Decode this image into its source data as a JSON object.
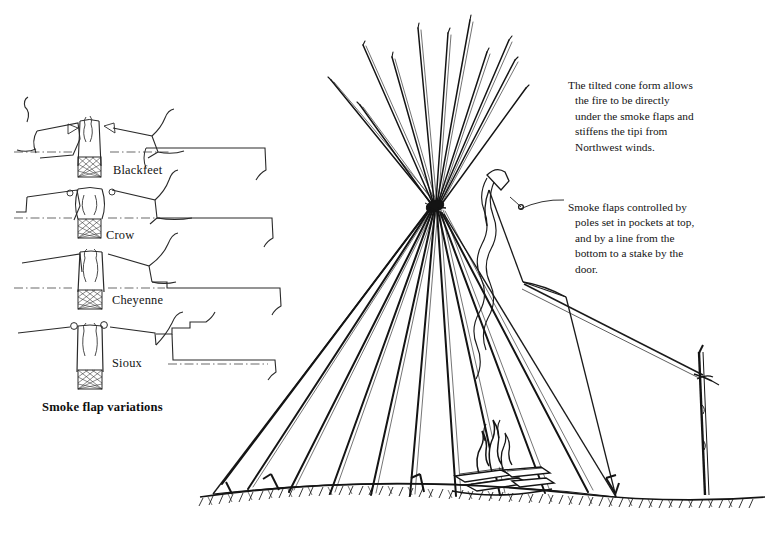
{
  "figure": {
    "background_color": "#ffffff",
    "ink_color": "#1a1a1a"
  },
  "annotations": [
    {
      "id": "tilted-cone",
      "text": "The tilted cone form allows the fire to be directly under the smoke flaps and stiffens the tipi from Northwest winds.",
      "has_leader_line": false
    },
    {
      "id": "smoke-flaps",
      "text": "Smoke flaps controlled by poles set in pockets at top, and by a line from the bottom to a stake by the door.",
      "has_leader_line": true
    }
  ],
  "variations": {
    "caption": "Smoke flap variations",
    "items": [
      {
        "label": "Blackfeet",
        "flap_detail": "triangular pocket sewn at flap tip, narrow chimney throat"
      },
      {
        "label": "Crow",
        "flap_detail": "round eyelets at flap tips, wide flaring chimney"
      },
      {
        "label": "Cheyenne",
        "flap_detail": "long tapering flaps with no eyelet, tall straight chimney"
      },
      {
        "label": "Sioux",
        "flap_detail": "ball-tipped flap corners, short squared chimney"
      }
    ]
  },
  "scene": {
    "elements": [
      {
        "name": "lodge-poles",
        "label": "lodge poles splayed above the tie point"
      },
      {
        "name": "tipi-cover",
        "label": "hide cover over the tilted cone"
      },
      {
        "name": "smoke-flap",
        "label": "smoke flap held by a pole in a pocket"
      },
      {
        "name": "anchor-rope",
        "label": "line from the flap bottom to a stake"
      },
      {
        "name": "ground-stake",
        "label": "stake by the door"
      },
      {
        "name": "fire",
        "label": "fire with logs directly under the smoke hole"
      },
      {
        "name": "smoke-column",
        "label": "smoke rising through the smoke hole"
      },
      {
        "name": "ground-line",
        "label": "hatched ground line"
      },
      {
        "name": "peg",
        "label": "cover pegs along the base"
      }
    ]
  }
}
